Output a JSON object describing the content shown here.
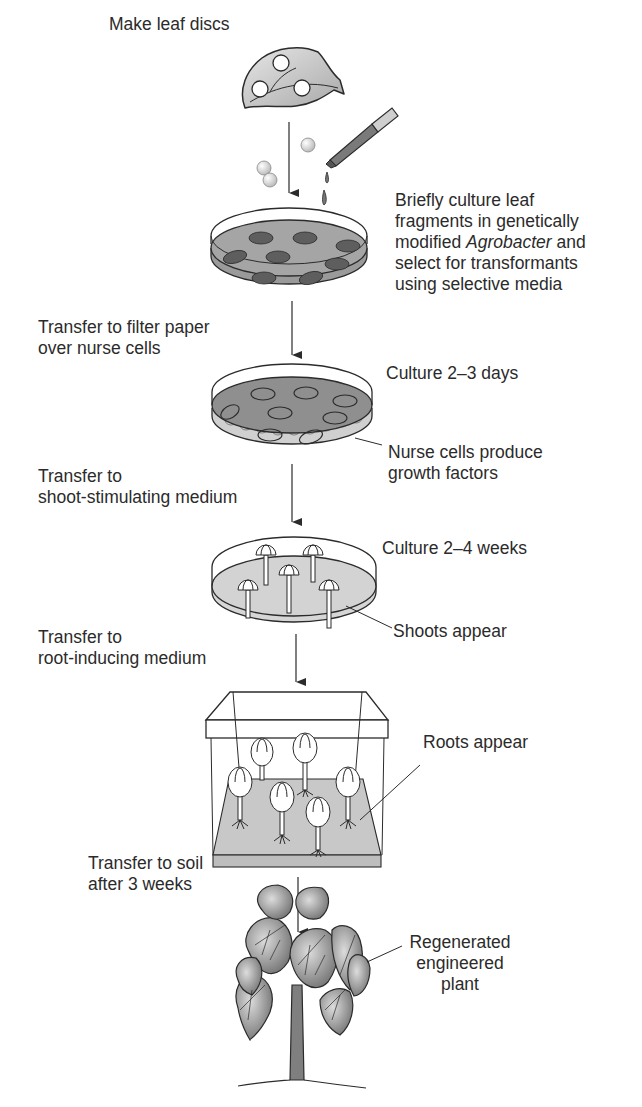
{
  "figure": {
    "steps": [
      {
        "id": "make-leaf-discs",
        "label": "Make leaf discs"
      },
      {
        "id": "agro-culture",
        "lines": [
          "Briefly culture leaf",
          "fragments in genetically",
          "modified ",
          "Agrobacter",
          " and",
          "select for transformants",
          "using selective media"
        ]
      },
      {
        "id": "transfer-filter",
        "lines": [
          "Transfer to filter paper",
          "over nurse cells"
        ]
      },
      {
        "id": "culture-days",
        "label": "Culture 2–3 days"
      },
      {
        "id": "nurse-cells",
        "lines": [
          "Nurse cells produce",
          "growth factors"
        ]
      },
      {
        "id": "transfer-shoot",
        "lines": [
          "Transfer to",
          "shoot-stimulating medium"
        ]
      },
      {
        "id": "culture-weeks",
        "label": "Culture 2–4 weeks"
      },
      {
        "id": "shoots-appear",
        "label": "Shoots appear"
      },
      {
        "id": "transfer-root",
        "lines": [
          "Transfer to",
          "root-inducing medium"
        ]
      },
      {
        "id": "roots-appear",
        "label": "Roots appear"
      },
      {
        "id": "transfer-soil",
        "lines": [
          "Transfer to soil",
          "after 3 weeks"
        ]
      },
      {
        "id": "regenerated-plant",
        "lines": [
          "Regenerated",
          "engineered",
          "plant"
        ]
      }
    ]
  },
  "colors": {
    "ink": "#2b2b2b",
    "dish_dark": "#8c8c8c",
    "dish_medium": "#b5b5b5",
    "dish_light": "#d9d9d9",
    "leaf_disc": "#5e5e5e"
  }
}
